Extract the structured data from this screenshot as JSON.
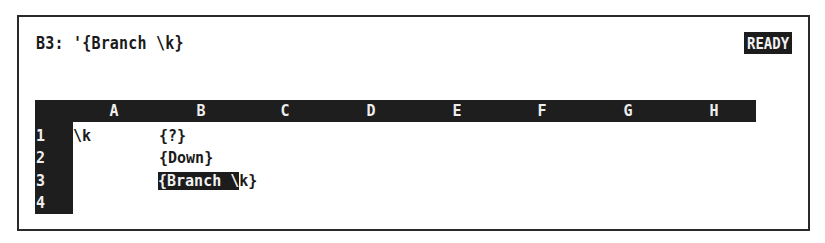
{
  "control_panel": {
    "cell_address": "B3:",
    "cell_contents": "'{Branch \\k}",
    "mode_indicator": "READY"
  },
  "worksheet": {
    "column_headers": [
      "A",
      "B",
      "C",
      "D",
      "E",
      "F",
      "G",
      "H"
    ],
    "row_headers": [
      "1",
      "2",
      "3",
      "4"
    ],
    "cells": {
      "A1": "\\k",
      "B1": "{?}",
      "B2": "{Down}",
      "B3_highlighted": "{Branch \\",
      "B3_overflow": "k}"
    },
    "cell_pointer": "B3"
  }
}
